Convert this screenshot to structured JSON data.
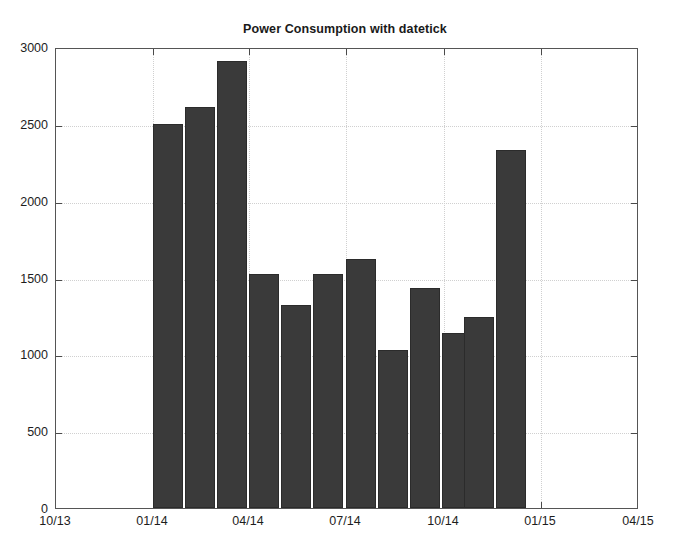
{
  "chart_data": {
    "type": "bar",
    "title": "Power Consumption with datetick",
    "xlabel": "",
    "ylabel": "",
    "grid": true,
    "legend": false,
    "legend_position": "none",
    "bar_color": "#3a3a3a",
    "bar_edge_color": "#2b2b2b",
    "ylim": [
      0,
      3000
    ],
    "ytick_values": [
      0,
      500,
      1000,
      1500,
      2000,
      2500,
      3000
    ],
    "ytick_labels": [
      "0",
      "500",
      "1000",
      "1500",
      "2000",
      "2500",
      "3000"
    ],
    "xtick_labels": [
      "10/13",
      "01/14",
      "04/14",
      "07/14",
      "10/14",
      "01/15",
      "04/15"
    ],
    "xlim_labels": [
      "10/13",
      "04/15"
    ],
    "categories": [
      "01/14",
      "02/14",
      "03/14",
      "04/14",
      "05/14",
      "06/14",
      "07/14",
      "08/14",
      "09/14",
      "10/14",
      "11/14",
      "12/14"
    ],
    "values": [
      2500,
      2610,
      2910,
      1520,
      1320,
      1520,
      1620,
      1030,
      1430,
      1140,
      1240,
      2330
    ],
    "bar_count": 12
  },
  "bars": [
    {
      "label": "01/14",
      "value": 2500,
      "x": 152,
      "w": 30
    },
    {
      "label": "02/14",
      "value": 2610,
      "x": 184,
      "w": 30
    },
    {
      "label": "03/14",
      "value": 2910,
      "x": 216,
      "w": 30
    },
    {
      "label": "04/14",
      "value": 1520,
      "x": 248,
      "w": 30
    },
    {
      "label": "05/14",
      "value": 1320,
      "x": 280,
      "w": 30
    },
    {
      "label": "06/14",
      "value": 1520,
      "x": 312,
      "w": 30
    },
    {
      "label": "07/14",
      "value": 1620,
      "x": 345,
      "w": 30
    },
    {
      "label": "08/14",
      "value": 1030,
      "x": 377,
      "w": 30
    },
    {
      "label": "09/14",
      "value": 1430,
      "x": 409,
      "w": 30
    },
    {
      "label": "10/14",
      "value": 1140,
      "x": 441,
      "w": 30
    },
    {
      "label": "11/14",
      "value": 1240,
      "x": 463,
      "w": 30
    },
    {
      "label": "12/14",
      "value": 2330,
      "x": 495,
      "w": 30
    }
  ],
  "ytick_positions": {
    "0": 509,
    "500": 436,
    "1000": 356,
    "1500": 278,
    "2000": 194,
    "2500": 121,
    "3000": 48
  },
  "xtick_positions": {
    "10/13": 55,
    "01/14": 152,
    "04/14": 248,
    "07/14": 345,
    "10/14": 443,
    "01/15": 540,
    "04/15": 638
  }
}
